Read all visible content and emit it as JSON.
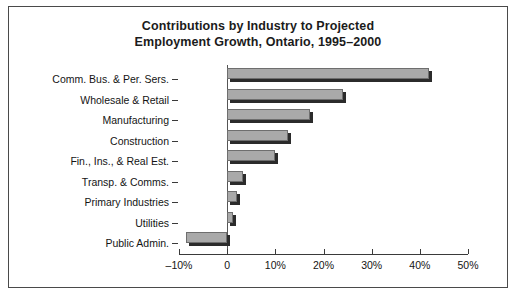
{
  "chart_data": {
    "type": "bar",
    "orientation": "horizontal",
    "title": "Contributions by Industry to Projected Employment Growth, Ontario, 1995–2000",
    "title_lines": [
      "Contributions by Industry to Projected",
      "Employment Growth, Ontario, 1995–2000"
    ],
    "categories": [
      "Comm. Bus. & Per. Sers.",
      "Wholesale & Retail",
      "Manufacturing",
      "Construction",
      "Fin., Ins., & Real Est.",
      "Transp. & Comms.",
      "Primary Industries",
      "Utilities",
      "Public Admin."
    ],
    "values": [
      41.9,
      24.0,
      17.3,
      12.7,
      10.0,
      3.3,
      2.0,
      1.3,
      -8.5
    ],
    "xlabel": "",
    "ylabel": "",
    "xlim": [
      -10,
      50
    ],
    "xticks": [
      -10,
      0,
      10,
      20,
      30,
      40,
      50
    ],
    "xtick_labels": [
      "–10%",
      "0",
      "10%",
      "20%",
      "30%",
      "40%",
      "50%"
    ],
    "grid": false,
    "legend": false,
    "bar_color": "#a9a9a9",
    "bar_edge_color": "#6e6e6e",
    "bar_shadow_color": "#2b2b2b",
    "axis_color": "#3a3a3a",
    "text_color": "#141414",
    "frame_color": "#4a4a4a",
    "background": "#ffffff"
  }
}
